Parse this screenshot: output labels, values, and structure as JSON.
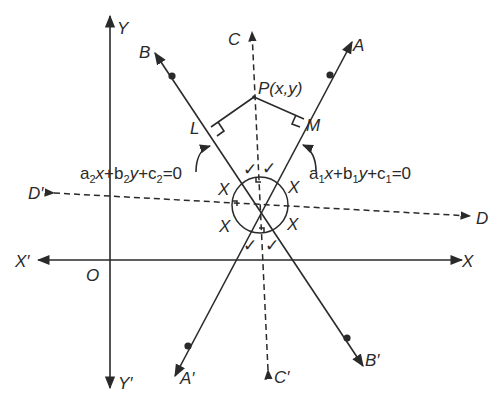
{
  "diagram": {
    "axes": {
      "x_pos": "X",
      "x_neg": "X′",
      "y_pos": "Y",
      "y_neg": "Y′",
      "origin": "O"
    },
    "lines": {
      "line1": {
        "end_pos": "A",
        "end_neg": "A′",
        "equation": {
          "a": "a",
          "a_sub": "1",
          "x": "x",
          "plus1": "+",
          "b": "b",
          "b_sub": "1",
          "y": "y",
          "plus2": "+",
          "c": "c",
          "c_sub": "1",
          "eq": "=0"
        }
      },
      "line2": {
        "end_pos": "B",
        "end_neg": "B′",
        "equation": {
          "a": "a",
          "a_sub": "2",
          "x": "x",
          "plus1": "+",
          "b": "b",
          "b_sub": "2",
          "y": "y",
          "plus2": "+",
          "c": "c",
          "c_sub": "2",
          "eq": "=0"
        }
      }
    },
    "bisectors": {
      "bisector1": {
        "end_pos": "C",
        "end_neg": "C′",
        "style": "dashed"
      },
      "bisector2": {
        "end_pos": "D",
        "end_neg": "D′",
        "style": "dashed"
      }
    },
    "point": {
      "name": "P",
      "coords": "(x,y)"
    },
    "feet": {
      "on_line2": "L",
      "on_line1": "M"
    },
    "angle_marks": {
      "x_label": "X",
      "check_mark": "✓"
    },
    "colors": {
      "ink": "#2a2a2a",
      "background": "#ffffff"
    }
  }
}
